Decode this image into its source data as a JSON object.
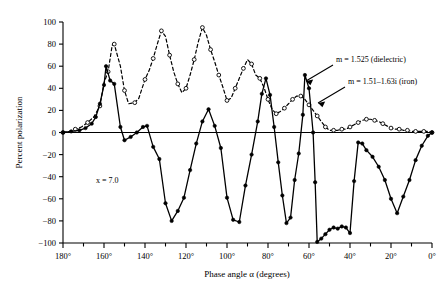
{
  "chart_data": {
    "type": "line",
    "title": "",
    "xlabel": "Phase angle α (degrees)",
    "ylabel": "Percent polarization",
    "xlim": [
      180,
      0
    ],
    "ylim": [
      -100,
      100
    ],
    "x_reversed": true,
    "grid": false,
    "legend_position": "inside-right-annotations",
    "x_tick_labels": [
      "180°",
      "160°",
      "140°",
      "120°",
      "100°",
      "80°",
      "60°",
      "40°",
      "20°",
      "0°"
    ],
    "x_tick_values": [
      180,
      160,
      140,
      120,
      100,
      80,
      60,
      40,
      20,
      0
    ],
    "x_minor_step": 10,
    "y_tick_labels": [
      "100",
      "80",
      "60",
      "40",
      "20",
      "0",
      "−20",
      "−40",
      "−60",
      "−80",
      "−100"
    ],
    "y_tick_values": [
      100,
      80,
      60,
      40,
      20,
      0,
      -20,
      -40,
      -60,
      -80,
      -100
    ],
    "annotations": [
      {
        "name": "x-parameter",
        "text": "x = 7.0",
        "x": 152,
        "y": -55
      },
      {
        "name": "dielectric-label",
        "text": "m = 1.525 (dielectric)",
        "x": 44,
        "y": 63
      },
      {
        "name": "iron-label",
        "text": "m = 1.51–1.63i (iron)",
        "x": 38,
        "y": 44
      }
    ],
    "series": [
      {
        "name": "m = 1.525 (dielectric)",
        "style": "dashed",
        "marker": "open-circle",
        "color": "#000000",
        "points": [
          [
            180,
            0
          ],
          [
            177,
            1
          ],
          [
            174,
            3
          ],
          [
            171,
            5
          ],
          [
            168,
            9
          ],
          [
            165,
            14
          ],
          [
            162,
            24
          ],
          [
            160,
            45
          ],
          [
            158,
            55
          ],
          [
            156,
            79
          ],
          [
            155,
            80
          ],
          [
            152,
            60
          ],
          [
            150,
            38
          ],
          [
            148,
            26
          ],
          [
            145,
            27
          ],
          [
            143,
            31
          ],
          [
            140,
            48
          ],
          [
            138,
            56
          ],
          [
            136,
            67
          ],
          [
            134,
            80
          ],
          [
            132,
            92
          ],
          [
            130,
            87
          ],
          [
            128,
            70
          ],
          [
            126,
            55
          ],
          [
            124,
            44
          ],
          [
            122,
            36
          ],
          [
            120,
            40
          ],
          [
            118,
            52
          ],
          [
            116,
            66
          ],
          [
            114,
            82
          ],
          [
            112,
            95
          ],
          [
            110,
            88
          ],
          [
            108,
            75
          ],
          [
            106,
            64
          ],
          [
            104,
            52
          ],
          [
            102,
            41
          ],
          [
            100,
            29
          ],
          [
            98,
            31
          ],
          [
            96,
            40
          ],
          [
            94,
            49
          ],
          [
            92,
            58
          ],
          [
            90,
            66
          ],
          [
            88,
            62
          ],
          [
            86,
            52
          ],
          [
            84,
            49
          ],
          [
            82,
            41
          ],
          [
            80,
            30
          ],
          [
            78,
            21
          ],
          [
            76,
            17
          ],
          [
            74,
            19
          ],
          [
            72,
            22
          ],
          [
            70,
            26
          ],
          [
            68,
            30
          ],
          [
            66,
            33
          ],
          [
            64,
            33
          ],
          [
            62,
            30
          ],
          [
            60,
            25
          ],
          [
            58,
            20
          ],
          [
            56,
            15
          ],
          [
            54,
            10
          ],
          [
            52,
            5
          ],
          [
            50,
            2
          ],
          [
            48,
            2
          ],
          [
            46,
            2
          ],
          [
            44,
            3
          ],
          [
            42,
            3
          ],
          [
            40,
            5
          ],
          [
            38,
            7
          ],
          [
            36,
            9
          ],
          [
            34,
            11
          ],
          [
            32,
            12
          ],
          [
            30,
            12
          ],
          [
            28,
            11
          ],
          [
            26,
            10
          ],
          [
            24,
            8
          ],
          [
            22,
            6
          ],
          [
            20,
            4
          ],
          [
            18,
            3
          ],
          [
            16,
            3
          ],
          [
            14,
            2
          ],
          [
            12,
            2
          ],
          [
            10,
            1
          ],
          [
            8,
            1
          ],
          [
            6,
            1
          ],
          [
            4,
            1
          ],
          [
            2,
            1
          ],
          [
            0,
            0
          ]
        ]
      },
      {
        "name": "m = 1.51–1.63i (iron)",
        "style": "solid",
        "marker": "filled-circle",
        "color": "#000000",
        "points": [
          [
            180,
            0
          ],
          [
            176,
            1
          ],
          [
            172,
            2
          ],
          [
            169,
            4
          ],
          [
            166,
            8
          ],
          [
            164,
            14
          ],
          [
            162,
            26
          ],
          [
            160,
            43
          ],
          [
            159,
            60
          ],
          [
            157,
            47
          ],
          [
            155,
            44
          ],
          [
            152,
            5
          ],
          [
            150,
            -7
          ],
          [
            147,
            -4
          ],
          [
            144,
            0
          ],
          [
            141,
            5
          ],
          [
            139,
            6
          ],
          [
            136,
            -13
          ],
          [
            133,
            -24
          ],
          [
            130,
            -64
          ],
          [
            127,
            -80
          ],
          [
            124,
            -71
          ],
          [
            121,
            -59
          ],
          [
            118,
            -34
          ],
          [
            115,
            -10
          ],
          [
            112,
            10
          ],
          [
            109,
            21
          ],
          [
            106,
            6
          ],
          [
            103,
            -14
          ],
          [
            100,
            -59
          ],
          [
            97,
            -79
          ],
          [
            94,
            -81
          ],
          [
            91,
            -48
          ],
          [
            88,
            -20
          ],
          [
            85,
            10
          ],
          [
            83,
            35
          ],
          [
            81,
            49
          ],
          [
            79,
            34
          ],
          [
            77,
            5
          ],
          [
            75,
            -27
          ],
          [
            73,
            -57
          ],
          [
            71,
            -82
          ],
          [
            69,
            -77
          ],
          [
            67,
            -43
          ],
          [
            65,
            -19
          ],
          [
            63,
            16
          ],
          [
            62,
            52
          ],
          [
            60,
            40
          ],
          [
            58,
            0
          ],
          [
            57,
            -45
          ],
          [
            56,
            -99
          ],
          [
            54,
            -96
          ],
          [
            52,
            -92
          ],
          [
            50,
            -88
          ],
          [
            48,
            -86
          ],
          [
            46,
            -87
          ],
          [
            44,
            -85
          ],
          [
            42,
            -86
          ],
          [
            40,
            -91
          ],
          [
            38,
            -44
          ],
          [
            36,
            -9
          ],
          [
            34,
            -10
          ],
          [
            32,
            -16
          ],
          [
            29,
            -22
          ],
          [
            26,
            -31
          ],
          [
            23,
            -43
          ],
          [
            20,
            -60
          ],
          [
            17,
            -73
          ],
          [
            14,
            -58
          ],
          [
            11,
            -43
          ],
          [
            8,
            -25
          ],
          [
            5,
            -12
          ],
          [
            2,
            -3
          ],
          [
            0,
            0
          ]
        ]
      }
    ]
  }
}
